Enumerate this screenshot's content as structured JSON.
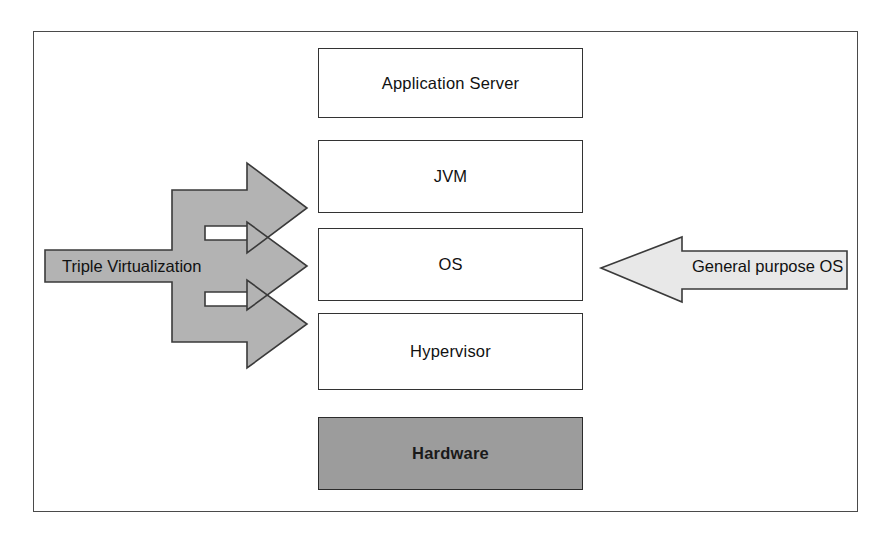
{
  "diagram": {
    "frame": {
      "border_color": "#4a4a4a"
    },
    "stack": {
      "boxes": [
        {
          "id": "application-server",
          "label": "Application Server",
          "fill": "#ffffff",
          "bold": false
        },
        {
          "id": "jvm",
          "label": "JVM",
          "fill": "#ffffff",
          "bold": false
        },
        {
          "id": "os",
          "label": "OS",
          "fill": "#ffffff",
          "bold": false
        },
        {
          "id": "hypervisor",
          "label": "Hypervisor",
          "fill": "#ffffff",
          "bold": false
        },
        {
          "id": "hardware",
          "label": "Hardware",
          "fill": "#9c9c9c",
          "bold": true
        }
      ]
    },
    "arrows": [
      {
        "id": "triple-virtualization",
        "label": "Triple Virtualization",
        "direction": "right",
        "prongs": 3,
        "fill": "#b3b3b3",
        "stroke": "#3a3a3a",
        "targets": [
          "JVM",
          "OS",
          "Hypervisor"
        ]
      },
      {
        "id": "general-purpose-os",
        "label": "General purpose OS",
        "direction": "left",
        "prongs": 1,
        "fill": "#e8e8e8",
        "stroke": "#3a3a3a",
        "targets": [
          "OS"
        ]
      }
    ]
  }
}
